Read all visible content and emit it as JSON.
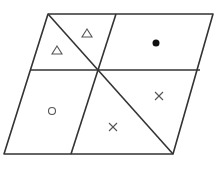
{
  "diagram": {
    "stroke_color": "#333333",
    "symbol_color": "#555555",
    "fill_dot_color": "#111111",
    "symbols": [
      {
        "region": "top-left-upper",
        "type": "triangle"
      },
      {
        "region": "top-left-lower",
        "type": "triangle"
      },
      {
        "region": "top-right",
        "type": "filled-dot"
      },
      {
        "region": "bottom-left",
        "type": "circle"
      },
      {
        "region": "bottom-middle",
        "type": "cross"
      },
      {
        "region": "bottom-right",
        "type": "cross"
      }
    ]
  }
}
